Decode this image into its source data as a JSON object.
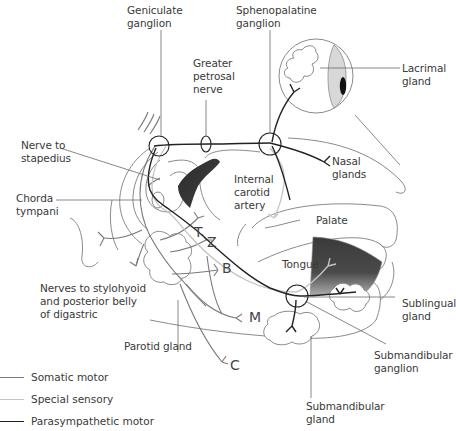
{
  "diagram": {
    "colors": {
      "somatic_motor": "#7a7a7a",
      "special_sensory": "#c4c4c4",
      "parasympathetic_motor": "#222222",
      "outline": "#8a8a8a",
      "shading_dark": "#3a3a3a"
    },
    "labels": {
      "geniculate_ganglion": "Geniculate\nganglion",
      "sphenopalatine_ganglion": "Sphenopalatine\nganglion",
      "greater_petrosal_nerve": "Greater\npetrosal\nnerve",
      "lacrimal_gland": "Lacrimal\ngland",
      "nerve_to_stapedius": "Nerve to\nstapedius",
      "nasal_glands": "Nasal\nglands",
      "internal_carotid_artery": "Internal\ncarotid\nartery",
      "chorda_tympani": "Chorda\ntympani",
      "palate": "Palate",
      "tongue": "Tongue",
      "nerves_to_stylohyoid": "Nerves to stylohyoid\nand posterior belly\nof digastric",
      "sublingual_gland": "Sublingual\ngland",
      "parotid_gland": "Parotid gland",
      "submandibular_ganglion": "Submandibular\nganglion",
      "submandibular_gland": "Submandibular\ngland"
    },
    "branch_letters": {
      "temporal": "T",
      "zygomatic": "Z",
      "buccal": "B",
      "marginal_mandibular": "M",
      "cervical": "C"
    },
    "legend": [
      {
        "label": "Somatic motor",
        "key": "somatic_motor"
      },
      {
        "label": "Special sensory",
        "key": "special_sensory"
      },
      {
        "label": "Parasympathetic motor",
        "key": "parasympathetic_motor"
      }
    ]
  }
}
